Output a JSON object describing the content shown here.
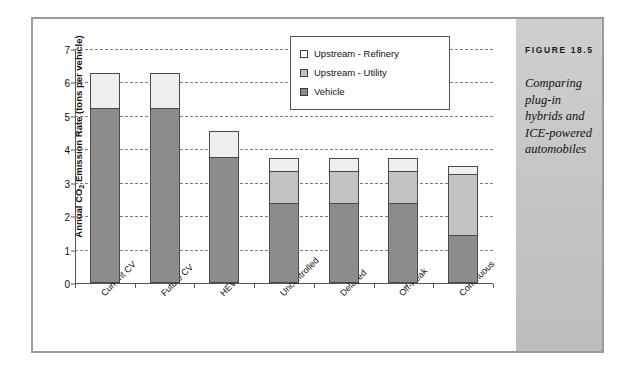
{
  "figure": {
    "caption_title": "FIGURE 18.5",
    "caption_body": "Comparing plug-in hybrids and ICE-powered automobiles"
  },
  "chart_data": {
    "type": "bar",
    "subtype": "stacked",
    "title": "",
    "xlabel": "",
    "ylabel": "Annual CO2 Emission Rate (tons per vehicle)",
    "ylabel_parts": {
      "prefix": "Annual CO",
      "sub": "2",
      "suffix": " Emission Rate (tons per vehicle)"
    },
    "categories": [
      "Current CV",
      "Future CV",
      "HEV",
      "Uncontrolled",
      "Delayed",
      "Off-Peak",
      "Continuous"
    ],
    "series": [
      {
        "name": "Vehicle",
        "color": "#8c8c8c",
        "values": [
          5.25,
          5.25,
          3.78,
          2.4,
          2.4,
          2.4,
          1.45
        ]
      },
      {
        "name": "Upstream - Utility",
        "color": "#c3c3c3",
        "values": [
          0.0,
          0.0,
          0.0,
          0.95,
          0.95,
          0.95,
          1.8
        ]
      },
      {
        "name": "Upstream - Refinery",
        "color": "#efefef",
        "values": [
          1.02,
          1.02,
          0.77,
          0.4,
          0.4,
          0.4,
          0.25
        ]
      }
    ],
    "totals": [
      6.27,
      6.27,
      4.55,
      3.75,
      3.75,
      3.75,
      3.5
    ],
    "ylim": [
      0,
      7
    ],
    "yticks": [
      0,
      1,
      2,
      3,
      4,
      5,
      6,
      7
    ],
    "ytick_labels": [
      "0",
      "1",
      "2",
      "3",
      "4",
      "5",
      "6",
      "7"
    ],
    "grid": true,
    "grid_style": "dashed-horizontal",
    "legend_position": "upper right",
    "legend_entries": [
      {
        "label": "Upstream - Refinery",
        "color": "#ffffff"
      },
      {
        "label": "Upstream - Utility",
        "color": "#c3c3c3"
      },
      {
        "label": "Vehicle",
        "color": "#8c8c8c"
      }
    ]
  }
}
